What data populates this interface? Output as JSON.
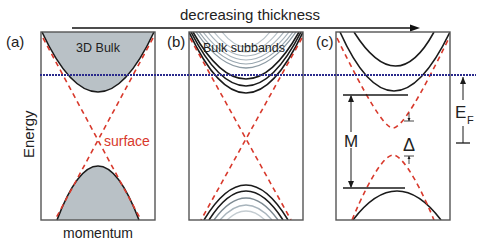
{
  "title": "decreasing thickness",
  "panels": [
    {
      "tag": "(a)",
      "label": "3D Bulk"
    },
    {
      "tag": "(b)",
      "label": "Bulk subbands"
    },
    {
      "tag": "(c)",
      "label": ""
    }
  ],
  "axes": {
    "ylabel": "Energy",
    "xlabel": "momentum"
  },
  "annotations": {
    "surface": "surface",
    "M": "M",
    "delta": "Δ",
    "fermi_main": "E",
    "fermi_sub": "F"
  },
  "colors": {
    "bulk_fill": "#b9c1c6",
    "surface": "#d8392c",
    "fermi": "#2a2a8c",
    "frame": "#555555",
    "curve": "#1a1a1a",
    "subband_light": "#a8b4bc"
  }
}
